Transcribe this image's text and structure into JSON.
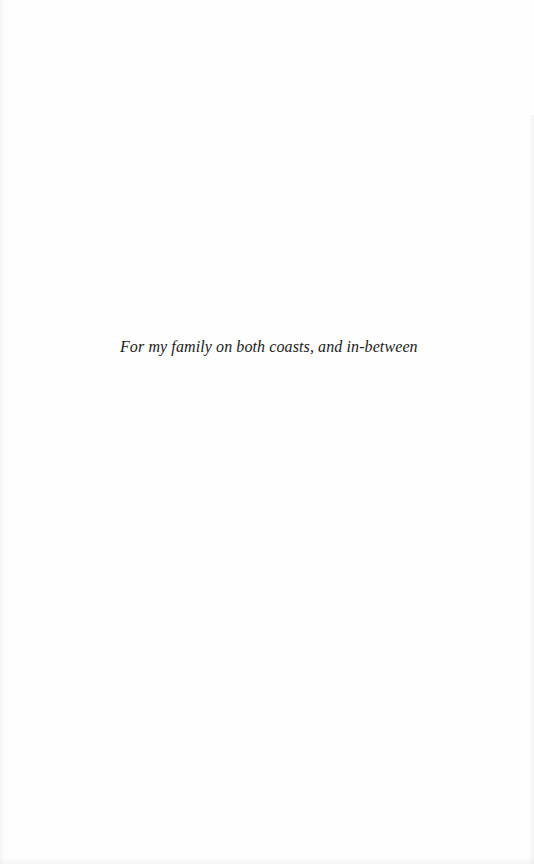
{
  "page": {
    "type": "dedication",
    "dedication_text": "For my family on both coasts, and in-between"
  },
  "colors": {
    "paper": "#fefefe",
    "text": "#1a1a1a"
  }
}
